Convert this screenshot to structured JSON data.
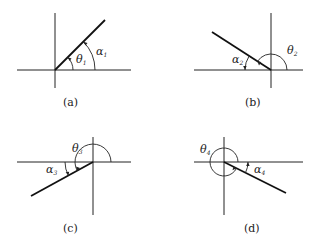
{
  "figure": {
    "panels": [
      {
        "id": "a",
        "caption": "(a)",
        "theta_label": "θ",
        "theta_sub": "1",
        "alpha_label": "α",
        "alpha_sub": "1",
        "quadrant": "I"
      },
      {
        "id": "b",
        "caption": "(b)",
        "theta_label": "θ",
        "theta_sub": "2",
        "alpha_label": "α",
        "alpha_sub": "2",
        "quadrant": "II"
      },
      {
        "id": "c",
        "caption": "(c)",
        "theta_label": "θ",
        "theta_sub": "3",
        "alpha_label": "α",
        "alpha_sub": "3",
        "quadrant": "III"
      },
      {
        "id": "d",
        "caption": "(d)",
        "theta_label": "θ",
        "theta_sub": "4",
        "alpha_label": "α",
        "alpha_sub": "4",
        "quadrant": "IV"
      }
    ]
  }
}
